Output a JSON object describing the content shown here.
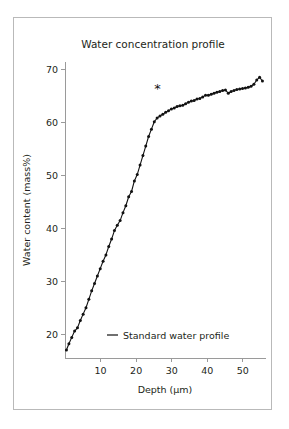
{
  "figure": {
    "background_color": "#ffffff",
    "border_color": "#b9b9b9",
    "axis_color": "#9a9a9a",
    "data_color": "#111111"
  },
  "chart_data": {
    "type": "line",
    "title": "Water concentration profile",
    "xlabel": "Depth (µm)",
    "ylabel": "Water content (mass%)",
    "xlim": [
      0,
      56.5
    ],
    "ylim": [
      15.5,
      71.5
    ],
    "xticks": [
      10,
      20,
      30,
      40,
      50
    ],
    "xticklabels": [
      "10",
      "20",
      "30",
      "40",
      "50"
    ],
    "yticks": [
      20,
      30,
      40,
      50,
      60,
      70
    ],
    "yticklabels": [
      "20",
      "30",
      "40",
      "50",
      "60",
      "70"
    ],
    "grid": false,
    "legend_position": "bottom-center",
    "markers": "filled-circle",
    "series": [
      {
        "name": "Standard water profile",
        "color": "#111111",
        "x": [
          0.4,
          1.1,
          1.9,
          2.7,
          3.5,
          4.3,
          5.1,
          5.9,
          6.7,
          7.5,
          8.3,
          9.1,
          9.9,
          10.7,
          11.5,
          12.3,
          13.1,
          13.9,
          14.7,
          15.5,
          16.3,
          17.1,
          17.9,
          18.7,
          19.5,
          20.3,
          21.1,
          21.9,
          22.7,
          23.5,
          24.3,
          25.1,
          25.9,
          26.7,
          27.5,
          28.3,
          29.1,
          29.9,
          30.7,
          31.5,
          32.3,
          33.1,
          33.9,
          34.7,
          35.5,
          36.3,
          37.1,
          37.9,
          38.7,
          39.5,
          40.3,
          41.1,
          41.9,
          42.7,
          43.5,
          44.3,
          45.1,
          45.9,
          46.7,
          47.5,
          48.3,
          49.1,
          49.9,
          50.7,
          51.5,
          52.3,
          53.1,
          53.9,
          54.7,
          55.5
        ],
        "y": [
          17.0,
          18.2,
          19.4,
          20.6,
          21.2,
          22.6,
          23.8,
          25.0,
          26.6,
          28.2,
          29.6,
          31.0,
          32.4,
          33.8,
          35.0,
          36.6,
          38.0,
          39.6,
          40.6,
          41.5,
          43.0,
          44.3,
          46.0,
          47.0,
          49.0,
          50.2,
          52.0,
          53.8,
          55.6,
          57.4,
          58.8,
          60.2,
          60.9,
          61.3,
          61.6,
          62.0,
          62.3,
          62.6,
          62.8,
          63.1,
          63.2,
          63.3,
          63.6,
          63.9,
          64.1,
          64.2,
          64.5,
          64.6,
          64.9,
          65.2,
          65.2,
          65.4,
          65.6,
          65.8,
          65.9,
          66.1,
          66.2,
          65.6,
          65.9,
          66.1,
          66.3,
          66.4,
          66.5,
          66.6,
          66.7,
          66.9,
          67.3,
          68.1,
          68.6,
          67.9
        ]
      }
    ],
    "annotations": [
      {
        "text": "*",
        "x": 26.0,
        "y": 65.6
      }
    ]
  },
  "legend": {
    "entries": [
      {
        "label": "Standard water profile",
        "marker": "line-dash",
        "color": "#111111"
      }
    ]
  }
}
